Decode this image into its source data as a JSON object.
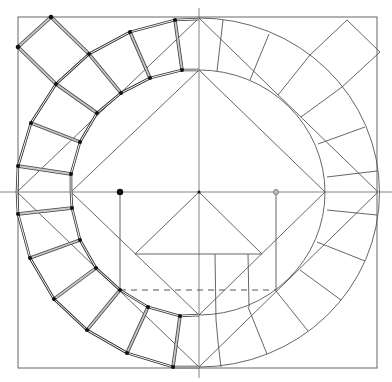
{
  "figure": {
    "type": "geometric construction drawing",
    "colors": {
      "line": "#555555",
      "background": "#ffffff",
      "node": "#111111",
      "open_node": "#bbbbbb"
    },
    "center": [
      199,
      192
    ],
    "frame": {
      "x": 18,
      "y": 17,
      "w": 359,
      "h": 351
    },
    "outer_circle": {
      "rx": 181,
      "ry": 174
    },
    "inner_circle": {
      "rx": 127,
      "ry": 122
    },
    "filled_marker": [
      120,
      192
    ],
    "open_marker": [
      276,
      192
    ],
    "dashed_line": {
      "x1": 120,
      "x2": 276,
      "y": 290
    }
  }
}
